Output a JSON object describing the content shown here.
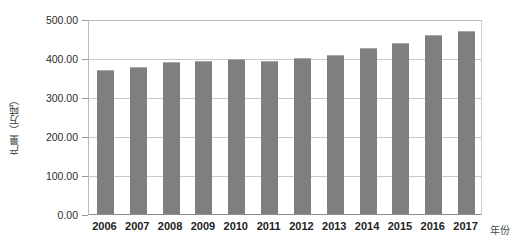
{
  "chart_data": {
    "type": "bar",
    "title": "",
    "xlabel": "年份",
    "ylabel": "产量（万吨）",
    "categories": [
      "2006",
      "2007",
      "2008",
      "2009",
      "2010",
      "2011",
      "2012",
      "2013",
      "2014",
      "2015",
      "2016",
      "2017"
    ],
    "values": [
      369,
      378,
      390,
      393,
      398,
      393,
      400,
      408,
      426,
      438,
      459,
      468
    ],
    "series": [
      {
        "name": "产量",
        "values": [
          369,
          378,
          390,
          393,
          398,
          393,
          400,
          408,
          426,
          438,
          459,
          468
        ]
      }
    ],
    "ylim": [
      0,
      500
    ],
    "ytick_labels": [
      "0.00",
      "100.00",
      "200.00",
      "300.00",
      "400.00",
      "500.00"
    ],
    "ytick_values": [
      0,
      100,
      200,
      300,
      400,
      500
    ],
    "grid": true,
    "legend": "none",
    "bar_color": "#7f7f7f",
    "gridline_color": "#c9c9c9",
    "plot_background": "#ffffff"
  }
}
